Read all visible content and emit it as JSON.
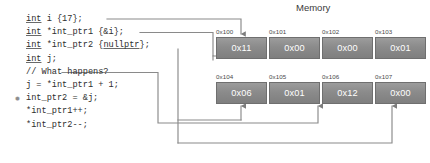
{
  "code": {
    "lines": [
      {
        "marker": "",
        "segments": [
          {
            "t": "int",
            "kw": true
          },
          {
            "t": " i {17};",
            "kw": false
          }
        ]
      },
      {
        "marker": "",
        "segments": [
          {
            "t": "int",
            "kw": true
          },
          {
            "t": " *int_ptr1 {&i};",
            "kw": false
          }
        ]
      },
      {
        "marker": "",
        "segments": [
          {
            "t": "int",
            "kw": true
          },
          {
            "t": " *int_ptr2 {",
            "kw": false
          },
          {
            "t": "nullptr",
            "kw": true
          },
          {
            "t": "};",
            "kw": false
          }
        ]
      },
      {
        "marker": "",
        "segments": [
          {
            "t": "int",
            "kw": true
          },
          {
            "t": " j;",
            "kw": false
          }
        ]
      },
      {
        "marker": "",
        "segments": [
          {
            "t": "// What happens?",
            "kw": false
          }
        ]
      },
      {
        "marker": "",
        "segments": [
          {
            "t": "j = *int_ptr1 + 1;",
            "kw": false
          }
        ]
      },
      {
        "marker": "✹",
        "segments": [
          {
            "t": "int_ptr2 = &j;",
            "kw": false
          }
        ]
      },
      {
        "marker": "",
        "segments": [
          {
            "t": "*int_ptr1++;",
            "kw": false
          }
        ]
      },
      {
        "marker": "",
        "segments": [
          {
            "t": "*int_ptr2--;",
            "kw": false
          }
        ]
      }
    ]
  },
  "memory": {
    "title": "Memory",
    "rows": [
      {
        "addresses": [
          "0x100",
          "0x101",
          "0x102",
          "0x103"
        ],
        "values": [
          "0x11",
          "0x00",
          "0x00",
          "0x01"
        ]
      },
      {
        "addresses": [
          "0x104",
          "0x105",
          "0x106",
          "0x107"
        ],
        "values": [
          "0x06",
          "0x01",
          "0x12",
          "0x00"
        ]
      }
    ]
  },
  "colors": {
    "cell_fill": "#8b8b8b",
    "cell_border": "#6f6f6f",
    "cell_text": "#ffffff",
    "wire": "#8a8a8a",
    "code_text": "#2e2e2e",
    "background": "#ffffff"
  }
}
